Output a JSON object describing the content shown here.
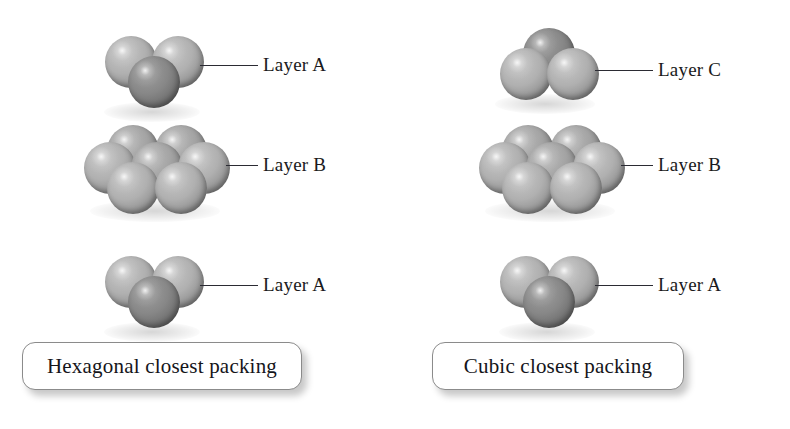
{
  "figure": {
    "background_color": "#ffffff",
    "line_color": "#2b2b33",
    "text_color": "#1a1a20",
    "sphere_colors": {
      "light": "#b0b0b0",
      "mid": "#a3a3a3",
      "dark": "#878787"
    }
  },
  "columns": [
    {
      "id": "hexagonal",
      "caption": "Hexagonal closest packing",
      "layers": [
        {
          "id": "hcp-top",
          "label": "Layer A",
          "sphere_count": 3,
          "arrangement": "two-back-light one-front-dark"
        },
        {
          "id": "hcp-middle",
          "label": "Layer B",
          "sphere_count": 7,
          "arrangement": "hexagonal close-packed 2-3-2"
        },
        {
          "id": "hcp-bottom",
          "label": "Layer A",
          "sphere_count": 3,
          "arrangement": "two-back-light one-front-dark"
        }
      ]
    },
    {
      "id": "cubic",
      "caption": "Cubic closest packing",
      "layers": [
        {
          "id": "ccp-top",
          "label": "Layer C",
          "sphere_count": 3,
          "arrangement": "one-back-dark two-front-light"
        },
        {
          "id": "ccp-middle",
          "label": "Layer B",
          "sphere_count": 7,
          "arrangement": "hexagonal close-packed 2-3-2"
        },
        {
          "id": "ccp-bottom",
          "label": "Layer A",
          "sphere_count": 3,
          "arrangement": "two-back-light one-front-dark"
        }
      ]
    }
  ]
}
